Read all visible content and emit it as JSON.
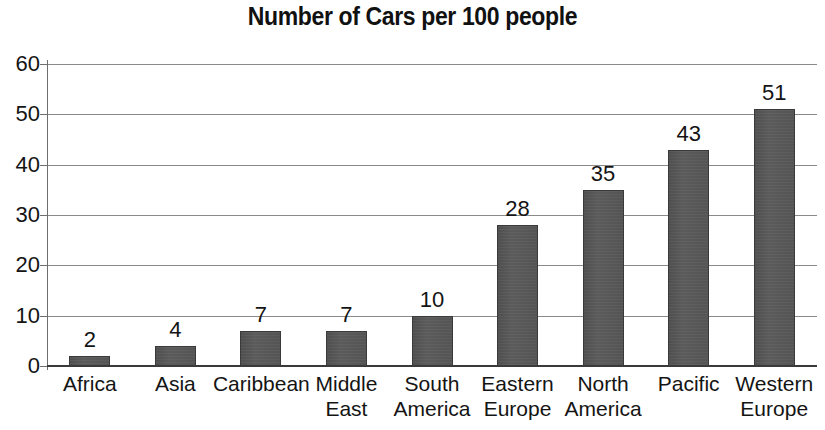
{
  "chart_data": {
    "type": "bar",
    "title": "Number of Cars per 100 people",
    "xlabel": "",
    "ylabel": "",
    "ylim": [
      0,
      60
    ],
    "yticks": [
      0,
      10,
      20,
      30,
      40,
      50,
      60
    ],
    "grid": true,
    "legend": "none",
    "bar_color": "#555555",
    "bar_edge_color": "#3a3a3a",
    "text_color": "#141414",
    "background_color": "#ffffff",
    "show_value_labels": true,
    "categories": [
      "Africa",
      "Asia",
      "Caribbean",
      "Middle East",
      "South America",
      "Eastern Europe",
      "North America",
      "Pacific",
      "Western Europe"
    ],
    "category_lines": [
      [
        "Africa"
      ],
      [
        "Asia"
      ],
      [
        "Caribbean"
      ],
      [
        "Middle",
        "East"
      ],
      [
        "South",
        "America"
      ],
      [
        "Eastern",
        "Europe"
      ],
      [
        "North",
        "America"
      ],
      [
        "Pacific"
      ],
      [
        "Western",
        "Europe"
      ]
    ],
    "values": [
      2,
      4,
      7,
      7,
      10,
      28,
      35,
      43,
      51
    ],
    "value_labels": [
      "2",
      "4",
      "7",
      "7",
      "10",
      "28",
      "35",
      "43",
      "51"
    ],
    "ytick_labels": [
      "60",
      "50",
      "40",
      "30",
      "20",
      "10",
      "0"
    ]
  }
}
